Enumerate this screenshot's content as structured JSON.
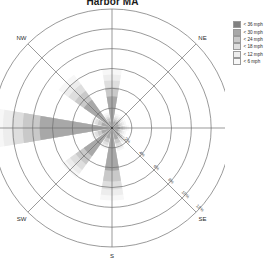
{
  "chart": {
    "title": "Harbor MA"
  },
  "legend": {
    "title": "",
    "items": [
      {
        "label": "< 36 mph",
        "color": "#808080"
      },
      {
        "label": "< 30 mph",
        "color": "#a8a8a8"
      },
      {
        "label": "< 24 mph",
        "color": "#c9c9c9"
      },
      {
        "label": "< 18 mph",
        "color": "#dedede"
      },
      {
        "label": "< 12 mph",
        "color": "#ededed"
      },
      {
        "label": "< 6 mph",
        "color": "#f7f7f7"
      }
    ]
  },
  "compass": {
    "labels": [
      "N",
      "NE",
      "E",
      "SE",
      "S",
      "SW",
      "W",
      "NW"
    ]
  },
  "radial_ticks": {
    "labels": [
      "2%",
      "4%",
      "6%",
      "8%",
      "10%",
      "12%"
    ]
  },
  "chart_data": {
    "type": "windrose",
    "title": "Harbor MA",
    "xlabel": "",
    "ylabel": "",
    "grid": true,
    "legend_position": "top-right",
    "radial_unit": "%",
    "radial_max": 12,
    "radial_ticks": [
      2,
      4,
      6,
      8,
      10,
      12
    ],
    "categories": [
      "N",
      "NNE",
      "NE",
      "ENE",
      "E",
      "ESE",
      "SE",
      "SSE",
      "S",
      "SSW",
      "SW",
      "WSW",
      "W",
      "WNW",
      "NW",
      "NNW"
    ],
    "directions_deg": [
      0,
      22.5,
      45,
      67.5,
      90,
      112.5,
      135,
      157.5,
      180,
      202.5,
      225,
      247.5,
      270,
      292.5,
      315,
      337.5
    ],
    "series": [
      {
        "name": "< 6 mph",
        "color": "#f7f7f7",
        "values": [
          5.9,
          1.5,
          1.6,
          1.5,
          1.7,
          1.5,
          2.0,
          2.4,
          7.3,
          2.2,
          6.2,
          2.2,
          11.8,
          2.2,
          6.6,
          1.6
        ]
      },
      {
        "name": "< 12 mph",
        "color": "#ededed",
        "values": [
          5.4,
          1.3,
          1.4,
          1.3,
          1.5,
          1.3,
          1.8,
          2.2,
          6.8,
          2.0,
          5.7,
          2.0,
          11.0,
          2.0,
          6.0,
          1.4
        ]
      },
      {
        "name": "< 18 mph",
        "color": "#dedede",
        "values": [
          4.8,
          1.1,
          1.2,
          1.1,
          1.3,
          1.1,
          1.6,
          1.9,
          6.2,
          1.8,
          5.2,
          1.8,
          10.1,
          1.8,
          5.4,
          1.2
        ]
      },
      {
        "name": "< 24 mph",
        "color": "#c9c9c9",
        "values": [
          4.1,
          0.9,
          1.0,
          0.9,
          1.1,
          0.9,
          1.3,
          1.6,
          5.4,
          1.5,
          4.5,
          1.5,
          9.0,
          1.5,
          4.6,
          1.0
        ]
      },
      {
        "name": "< 30 mph",
        "color": "#a8a8a8",
        "values": [
          3.2,
          0.7,
          0.8,
          0.7,
          0.8,
          0.7,
          1.0,
          1.2,
          4.3,
          1.1,
          3.5,
          1.1,
          7.3,
          1.1,
          3.5,
          0.7
        ]
      },
      {
        "name": "< 36 mph",
        "color": "#808080",
        "values": [
          0.0,
          0.0,
          0.0,
          0.0,
          0.0,
          0.0,
          0.0,
          0.0,
          0.0,
          0.0,
          0.0,
          0.0,
          0.0,
          0.0,
          0.0,
          0.0
        ]
      }
    ]
  }
}
